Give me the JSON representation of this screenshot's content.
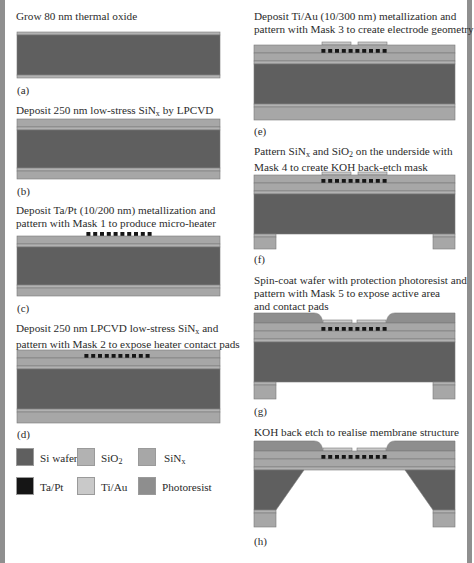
{
  "figure": {
    "colors": {
      "si_wafer": "#5f5f5f",
      "sio2": "#b2b2b2",
      "sinx": "#a7a7a7",
      "ta_pt": "#151515",
      "ti_au": "#c9c9c9",
      "photoresist": "#8e8e8e",
      "edge_bar": "#8f8f8f"
    },
    "steps": [
      {
        "id": "a",
        "label": "(a)",
        "caption_lines": [
          "Grow 80 nm thermal oxide"
        ]
      },
      {
        "id": "b",
        "label": "(b)",
        "caption_lines": [
          "Deposit 250 nm low-stress SiN",
          "x",
          " by LPCVD"
        ]
      },
      {
        "id": "c",
        "label": "(c)",
        "caption_lines": [
          "Deposit Ta/Pt (10/200 nm) metallization and",
          "pattern with Mask 1 to produce micro-heater"
        ]
      },
      {
        "id": "d",
        "label": "(d)",
        "caption_lines": [
          "Deposit 250 nm LPCVD low-stress SiN",
          "x",
          " and",
          "pattern with Mask 2 to expose heater contact pads"
        ]
      },
      {
        "id": "e",
        "label": "(e)",
        "caption_lines": [
          "Deposit Ti/Au (10/300 nm) metallization and",
          "pattern with Mask 3 to create electrode geometry"
        ]
      },
      {
        "id": "f",
        "label": "(f)",
        "caption_lines": [
          "Pattern SiN",
          "x",
          " and SiO",
          "2",
          " on the underside with",
          "Mask 4 to create KOH back-etch mask"
        ]
      },
      {
        "id": "g",
        "label": "(g)",
        "caption_lines": [
          "Spin-coat wafer with protection photoresist and",
          "pattern with Mask 5 to expose active area",
          "and contact pads"
        ]
      },
      {
        "id": "h",
        "label": "(h)",
        "caption_lines": [
          "KOH back etch to realise membrane structure"
        ]
      }
    ],
    "legend": [
      {
        "key": "si_wafer",
        "label": "Si wafer",
        "sub": ""
      },
      {
        "key": "sio2",
        "label": "SiO",
        "sub": "2"
      },
      {
        "key": "sinx",
        "label": "SiN",
        "sub": "x"
      },
      {
        "key": "ta_pt",
        "label": "Ta/Pt",
        "sub": ""
      },
      {
        "key": "ti_au",
        "label": "Ti/Au",
        "sub": ""
      },
      {
        "key": "photoresist",
        "label": "Photoresist",
        "sub": ""
      }
    ],
    "heater_segments": 10
  }
}
